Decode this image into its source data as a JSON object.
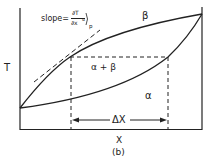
{
  "diagram": {
    "axis_y_label": "T",
    "axis_x_label": "X",
    "caption": "(b)",
    "curve_top_label": "β",
    "two_phase_label": "α + β",
    "alpha_label": "α",
    "delta_label": "ΔX",
    "slope_text": "slope=",
    "slope_numerator": "∂T",
    "slope_denominator": "∂x",
    "slope_sup": "α",
    "slope_sub": "p"
  }
}
